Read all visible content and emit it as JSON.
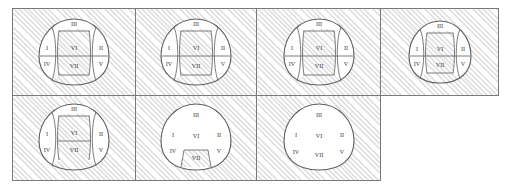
{
  "figure": {
    "title": "",
    "colors": {
      "hatch": "#787878",
      "cell_border": "#7a7a7a",
      "outline": "#5f5f5f",
      "divider": "#6d6d6d",
      "numeral": "#3a3a3a",
      "panel_fill": "#ffffff"
    },
    "grid": {
      "columns": 4,
      "rows": 2,
      "row_cell_counts": [
        4,
        3
      ]
    },
    "numerals": {
      "I": "I",
      "II": "II",
      "III": "III",
      "IV": "IV",
      "V": "V",
      "VI": "VI",
      "VII": "VII"
    },
    "panels": [
      {
        "id": "panel-1",
        "row": 1,
        "col": 1,
        "labels": [
          "I",
          "II",
          "III",
          "IV",
          "V",
          "VI",
          "VII"
        ],
        "white_regions": [
          "I",
          "IV",
          "II",
          "III"
        ],
        "hatched_regions": [
          "VI",
          "VII",
          "V"
        ],
        "dividers": [
          "left-lobe",
          "right-lobe",
          "horizontal-mid",
          "center-left",
          "center-right",
          "center-horizontal"
        ]
      },
      {
        "id": "panel-2",
        "row": 1,
        "col": 2,
        "labels": [
          "I",
          "II",
          "III",
          "IV",
          "V",
          "VI",
          "VII"
        ],
        "white_regions": [
          "I",
          "IV",
          "II",
          "III"
        ],
        "hatched_regions": [
          "VI",
          "VII",
          "V"
        ],
        "dividers": [
          "left-lobe",
          "right-lobe",
          "horizontal-mid",
          "center-left",
          "center-right",
          "center-horizontal"
        ]
      },
      {
        "id": "panel-3",
        "row": 1,
        "col": 3,
        "labels": [
          "I",
          "II",
          "III",
          "IV",
          "V",
          "VI",
          "VII"
        ],
        "white_regions": [
          "I",
          "IV",
          "II",
          "III"
        ],
        "hatched_regions": [
          "VI",
          "VII",
          "V"
        ],
        "dividers": [
          "left-lobe",
          "right-lobe",
          "horizontal-mid",
          "center-left",
          "center-right",
          "center-horizontal"
        ]
      },
      {
        "id": "panel-4",
        "row": 1,
        "col": 4,
        "labels": [
          "I",
          "II",
          "III",
          "IV",
          "V",
          "VI",
          "VII"
        ],
        "white_regions": [
          "I",
          "IV",
          "II",
          "III"
        ],
        "hatched_regions": [
          "VI",
          "VII",
          "V"
        ],
        "dividers": [
          "left-lobe",
          "right-lobe",
          "horizontal-mid",
          "center-left",
          "center-right",
          "center-horizontal"
        ]
      },
      {
        "id": "panel-5",
        "row": 2,
        "col": 1,
        "labels": [
          "I",
          "II",
          "III",
          "IV",
          "V",
          "VI",
          "VII"
        ],
        "white_regions": [
          "I",
          "IV",
          "II",
          "V",
          "III"
        ],
        "hatched_regions": [
          "VI",
          "VII"
        ],
        "dividers": [
          "left-lobe",
          "right-lobe",
          "center-left",
          "center-right",
          "center-horizontal",
          "top-arc"
        ]
      },
      {
        "id": "panel-6",
        "row": 2,
        "col": 2,
        "labels": [
          "I",
          "II",
          "III",
          "IV",
          "V",
          "VI",
          "VII"
        ],
        "white_regions": [
          "whole-dome"
        ],
        "hatched_regions": [
          "VII"
        ],
        "dividers": [
          "vii-box"
        ]
      },
      {
        "id": "panel-7",
        "row": 2,
        "col": 3,
        "labels": [
          "I",
          "II",
          "III",
          "IV",
          "V",
          "VI",
          "VII"
        ],
        "white_regions": [
          "whole-dome"
        ],
        "hatched_regions": [],
        "dividers": []
      }
    ]
  }
}
